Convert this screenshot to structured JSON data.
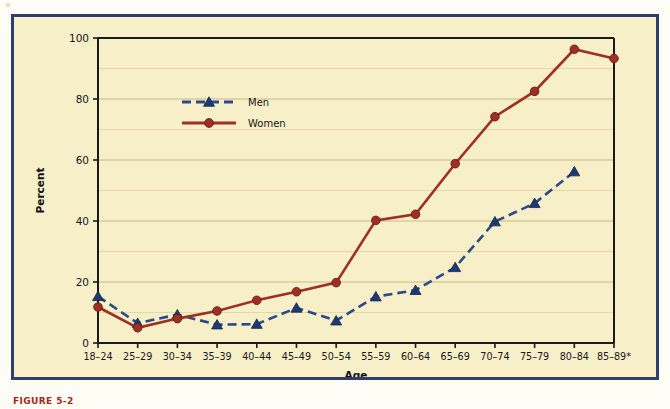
{
  "figure": {
    "caption_partial": "FIGURE 5-2",
    "frame_color": "#2e3f6e",
    "background_color": "#f6efc8"
  },
  "chart_data": {
    "type": "line",
    "title": "",
    "xlabel": "Age",
    "ylabel": "Percent",
    "ylim": [
      0,
      100
    ],
    "yticks": [
      0,
      20,
      40,
      60,
      80,
      100
    ],
    "ytick_labels": [
      "0",
      "20",
      "40",
      "60",
      "80",
      "100"
    ],
    "minor_gridlines": [
      10,
      30,
      50,
      70,
      90
    ],
    "grid": true,
    "legend_position": "upper-left-inside",
    "categories": [
      "18–24",
      "25–29",
      "30–34",
      "35–39",
      "40–44",
      "45–49",
      "50–54",
      "55–59",
      "60–64",
      "65–69",
      "70–74",
      "75–79",
      "80–84",
      "85–89*"
    ],
    "series": [
      {
        "name": "Men",
        "color": "#2b4a8b",
        "marker": "triangle",
        "linestyle": "dashed",
        "values": [
          15.3,
          6.5,
          9.3,
          6.0,
          6.2,
          11.5,
          7.3,
          15.2,
          17.3,
          24.8,
          39.8,
          45.8,
          56.2,
          null
        ]
      },
      {
        "name": "Women",
        "color": "#9e2f22",
        "marker": "circle",
        "linestyle": "solid",
        "values": [
          11.8,
          5.0,
          8.0,
          10.5,
          14.0,
          16.8,
          19.8,
          40.2,
          42.2,
          58.8,
          74.2,
          82.5,
          96.3,
          93.3
        ]
      }
    ]
  },
  "legend": {
    "items": [
      {
        "label": "Men"
      },
      {
        "label": "Women"
      }
    ]
  }
}
